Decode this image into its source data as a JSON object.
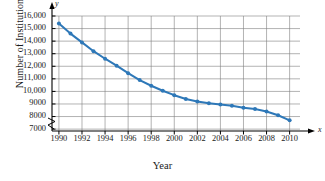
{
  "chart_data": {
    "type": "line",
    "title": "",
    "xlabel": "Year",
    "ylabel": "Number of Institutions",
    "x_axis_letter": "x",
    "y_axis_letter": "y",
    "xlim": [
      1989.4,
      2010.9
    ],
    "ylim": [
      6850,
      16000
    ],
    "y_axis_break": true,
    "grid": true,
    "legend": null,
    "xticks": [
      1990,
      1992,
      1994,
      1996,
      1998,
      2000,
      2002,
      2004,
      2006,
      2008,
      2010
    ],
    "xtick_labels": [
      "1990",
      "1992",
      "1994",
      "1996",
      "1998",
      "2000",
      "2002",
      "2004",
      "2006",
      "2008",
      "2010"
    ],
    "yticks": [
      7000,
      8000,
      9000,
      10000,
      11000,
      12000,
      13000,
      14000,
      15000,
      16000
    ],
    "ytick_labels": [
      "7000",
      "8000",
      "9000",
      "10,000",
      "11,000",
      "12,000",
      "13,000",
      "14,000",
      "15,000",
      "16,000"
    ],
    "series_color": "#2E78B8",
    "marker": "circle",
    "x": [
      1990,
      1991,
      1992,
      1993,
      1994,
      1995,
      1996,
      1997,
      1998,
      1999,
      2000,
      2001,
      2002,
      2003,
      2004,
      2005,
      2006,
      2007,
      2008,
      2009,
      2010
    ],
    "values": [
      15400,
      14600,
      13900,
      13200,
      12600,
      12050,
      11450,
      10900,
      10450,
      10050,
      9700,
      9400,
      9200,
      9050,
      8950,
      8850,
      8700,
      8600,
      8400,
      8100,
      7700
    ]
  }
}
